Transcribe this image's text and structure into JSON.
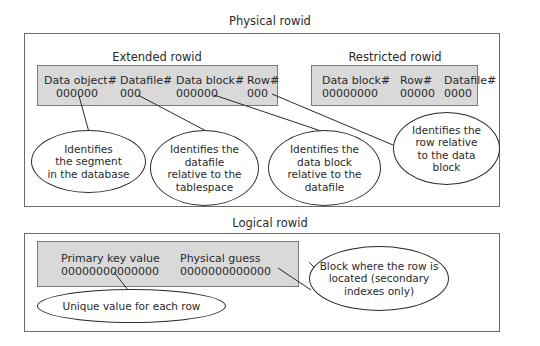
{
  "physical": {
    "title": "Physical rowid",
    "extended": {
      "title": "Extended rowid",
      "fields": [
        {
          "label": "Data object#",
          "value": "000000"
        },
        {
          "label": "Datafile#",
          "value": "000"
        },
        {
          "label": "Data block#",
          "value": "000000"
        },
        {
          "label": "Row#",
          "value": "000"
        }
      ]
    },
    "restricted": {
      "title": "Restricted rowid",
      "fields": [
        {
          "label": "Data block#",
          "value": "00000000"
        },
        {
          "label": "Row#",
          "value": "00000"
        },
        {
          "label": "Datafile#",
          "value": "0000"
        }
      ]
    },
    "callouts": [
      {
        "text": "Identifies the segment in the database",
        "lines": [
          "Identifies",
          "the segment",
          "in the database"
        ]
      },
      {
        "text": "Identifies the datafile relative to the tablespace",
        "lines": [
          "Identifies the",
          "datafile",
          "relative to the",
          "tablespace"
        ]
      },
      {
        "text": "Identifies the data block relative to the datafile",
        "lines": [
          "Identifies the",
          "data block",
          "relative to the",
          "datafile"
        ]
      },
      {
        "text": "Identifies the row relative to the data block",
        "lines": [
          "Identifies the",
          "row relative",
          "to the data",
          "block"
        ]
      }
    ]
  },
  "logical": {
    "title": "Logical rowid",
    "fields": [
      {
        "label": "Primary key value",
        "value": "00000000000000"
      },
      {
        "label": "Physical guess",
        "value": "0000000000000"
      }
    ],
    "callouts": [
      {
        "text": "Unique value for each row",
        "lines": [
          "Unique value for each row"
        ]
      },
      {
        "text": "Block where the row is located (secondary indexes only)",
        "lines": [
          "Block where the row is",
          "located (secondary",
          "indexes only)"
        ]
      }
    ]
  },
  "colors": {
    "field_fill": "#d9d9d9",
    "frame_border": "#6b6b6b",
    "line": "#2a2a2a"
  }
}
